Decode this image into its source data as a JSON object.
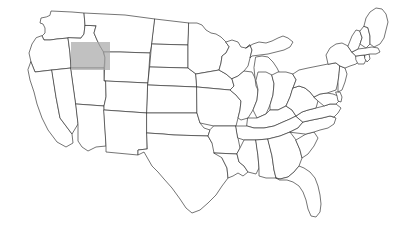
{
  "figure": {
    "type": "choropleth-outline-map",
    "title": "",
    "subtitle": "",
    "caption": "",
    "background_color": "#ffffff",
    "width": 394,
    "height": 240
  },
  "map": {
    "region": "United States",
    "projection_look": "contiguous-48-states",
    "outline_color": "#3a3a3a",
    "outline_width": 0.7,
    "state_fill_color": "#ffffff",
    "includes_alaska": false,
    "includes_hawaii": false,
    "state_count": 48,
    "labels_visible": false,
    "legend_visible": false,
    "border_visible": false
  },
  "highlight": {
    "shape": "rectangle",
    "color": "#a9a9a9",
    "opacity": 0.72,
    "x": 71,
    "y": 42,
    "width": 39,
    "height": 28,
    "covers_region": "Idaho / western Wyoming",
    "states_overlapped": [
      "Idaho",
      "Wyoming",
      "Montana",
      "Utah"
    ]
  },
  "states": [
    {
      "name": "Washington",
      "abbr": "WA",
      "highlighted": false
    },
    {
      "name": "Oregon",
      "abbr": "OR",
      "highlighted": false
    },
    {
      "name": "California",
      "abbr": "CA",
      "highlighted": false
    },
    {
      "name": "Nevada",
      "abbr": "NV",
      "highlighted": false
    },
    {
      "name": "Idaho",
      "abbr": "ID",
      "highlighted": true
    },
    {
      "name": "Montana",
      "abbr": "MT",
      "highlighted": false
    },
    {
      "name": "Wyoming",
      "abbr": "WY",
      "highlighted": true
    },
    {
      "name": "Utah",
      "abbr": "UT",
      "highlighted": false
    },
    {
      "name": "Arizona",
      "abbr": "AZ",
      "highlighted": false
    },
    {
      "name": "Colorado",
      "abbr": "CO",
      "highlighted": false
    },
    {
      "name": "New Mexico",
      "abbr": "NM",
      "highlighted": false
    },
    {
      "name": "North Dakota",
      "abbr": "ND",
      "highlighted": false
    },
    {
      "name": "South Dakota",
      "abbr": "SD",
      "highlighted": false
    },
    {
      "name": "Nebraska",
      "abbr": "NE",
      "highlighted": false
    },
    {
      "name": "Kansas",
      "abbr": "KS",
      "highlighted": false
    },
    {
      "name": "Oklahoma",
      "abbr": "OK",
      "highlighted": false
    },
    {
      "name": "Texas",
      "abbr": "TX",
      "highlighted": false
    },
    {
      "name": "Minnesota",
      "abbr": "MN",
      "highlighted": false
    },
    {
      "name": "Iowa",
      "abbr": "IA",
      "highlighted": false
    },
    {
      "name": "Missouri",
      "abbr": "MO",
      "highlighted": false
    },
    {
      "name": "Arkansas",
      "abbr": "AR",
      "highlighted": false
    },
    {
      "name": "Louisiana",
      "abbr": "LA",
      "highlighted": false
    },
    {
      "name": "Wisconsin",
      "abbr": "WI",
      "highlighted": false
    },
    {
      "name": "Illinois",
      "abbr": "IL",
      "highlighted": false
    },
    {
      "name": "Michigan",
      "abbr": "MI",
      "highlighted": false
    },
    {
      "name": "Indiana",
      "abbr": "IN",
      "highlighted": false
    },
    {
      "name": "Ohio",
      "abbr": "OH",
      "highlighted": false
    },
    {
      "name": "Kentucky",
      "abbr": "KY",
      "highlighted": false
    },
    {
      "name": "Tennessee",
      "abbr": "TN",
      "highlighted": false
    },
    {
      "name": "Mississippi",
      "abbr": "MS",
      "highlighted": false
    },
    {
      "name": "Alabama",
      "abbr": "AL",
      "highlighted": false
    },
    {
      "name": "Georgia",
      "abbr": "GA",
      "highlighted": false
    },
    {
      "name": "Florida",
      "abbr": "FL",
      "highlighted": false
    },
    {
      "name": "South Carolina",
      "abbr": "SC",
      "highlighted": false
    },
    {
      "name": "North Carolina",
      "abbr": "NC",
      "highlighted": false
    },
    {
      "name": "Virginia",
      "abbr": "VA",
      "highlighted": false
    },
    {
      "name": "West Virginia",
      "abbr": "WV",
      "highlighted": false
    },
    {
      "name": "Maryland",
      "abbr": "MD",
      "highlighted": false
    },
    {
      "name": "Delaware",
      "abbr": "DE",
      "highlighted": false
    },
    {
      "name": "Pennsylvania",
      "abbr": "PA",
      "highlighted": false
    },
    {
      "name": "New Jersey",
      "abbr": "NJ",
      "highlighted": false
    },
    {
      "name": "New York",
      "abbr": "NY",
      "highlighted": false
    },
    {
      "name": "Connecticut",
      "abbr": "CT",
      "highlighted": false
    },
    {
      "name": "Rhode Island",
      "abbr": "RI",
      "highlighted": false
    },
    {
      "name": "Massachusetts",
      "abbr": "MA",
      "highlighted": false
    },
    {
      "name": "Vermont",
      "abbr": "VT",
      "highlighted": false
    },
    {
      "name": "New Hampshire",
      "abbr": "NH",
      "highlighted": false
    },
    {
      "name": "Maine",
      "abbr": "ME",
      "highlighted": false
    }
  ],
  "chart_data": {
    "type": "map",
    "title": "",
    "xlabel": "",
    "ylabel": "",
    "legend_position": "none",
    "grid": false,
    "categories": [
      "Washington",
      "Oregon",
      "California",
      "Nevada",
      "Idaho",
      "Montana",
      "Wyoming",
      "Utah",
      "Arizona",
      "Colorado",
      "New Mexico",
      "North Dakota",
      "South Dakota",
      "Nebraska",
      "Kansas",
      "Oklahoma",
      "Texas",
      "Minnesota",
      "Iowa",
      "Missouri",
      "Arkansas",
      "Louisiana",
      "Wisconsin",
      "Illinois",
      "Michigan",
      "Indiana",
      "Ohio",
      "Kentucky",
      "Tennessee",
      "Mississippi",
      "Alabama",
      "Georgia",
      "Florida",
      "South Carolina",
      "North Carolina",
      "Virginia",
      "West Virginia",
      "Maryland",
      "Delaware",
      "Pennsylvania",
      "New Jersey",
      "New York",
      "Connecticut",
      "Rhode Island",
      "Massachusetts",
      "Vermont",
      "New Hampshire",
      "Maine"
    ],
    "values": [
      0,
      0,
      0,
      0,
      1,
      0,
      1,
      0,
      0,
      0,
      0,
      0,
      0,
      0,
      0,
      0,
      0,
      0,
      0,
      0,
      0,
      0,
      0,
      0,
      0,
      0,
      0,
      0,
      0,
      0,
      0,
      0,
      0,
      0,
      0,
      0,
      0,
      0,
      0,
      0,
      0,
      0,
      0,
      0,
      0,
      0,
      0,
      0
    ],
    "value_meaning": "1 = covered by gray highlight rectangle, 0 = not covered",
    "colors": {
      "highlighted": "#a9a9a9",
      "default": "#ffffff",
      "outline": "#3a3a3a"
    }
  }
}
